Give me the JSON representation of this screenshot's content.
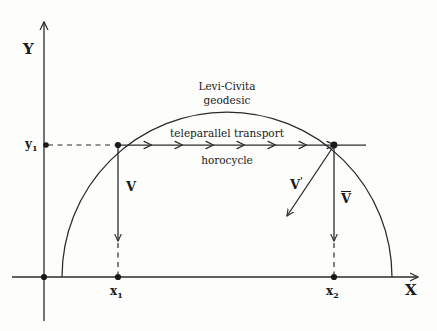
{
  "figure": {
    "background_color": "#fdfdfb",
    "ink_color": "#2b2b2b",
    "text_color": "#1a1a1a"
  },
  "axes": {
    "x_label": "X",
    "y_label": "Y",
    "origin_label": "",
    "x_tick_labels": [
      "x",
      "x"
    ],
    "y_tick_labels": [
      "y"
    ]
  },
  "ticks": {
    "x1": {
      "label_base": "x",
      "label_sub": "1",
      "x": 118,
      "y": 277
    },
    "x2": {
      "label_base": "x",
      "label_sub": "2",
      "x": 334,
      "y": 277
    },
    "y1": {
      "label_base": "y",
      "label_sub": "1",
      "x": 30,
      "y": 145
    }
  },
  "annotations": {
    "geodesic_line1": "Levi-Civita",
    "geodesic_line2": "geodesic",
    "transport_line1": "teleparallel transport",
    "transport_line2": "horocycle"
  },
  "vectors": {
    "v": {
      "label": "V",
      "prime": ""
    },
    "v_prime": {
      "label": "V",
      "prime": "'"
    },
    "v_bar": {
      "label": "V",
      "overline": true
    }
  },
  "geometry": {
    "semicircle_center_x": 227,
    "semicircle_radius": 165,
    "baseline_y": 277,
    "horocycle_y": 145,
    "arrowhead_count": 7
  }
}
